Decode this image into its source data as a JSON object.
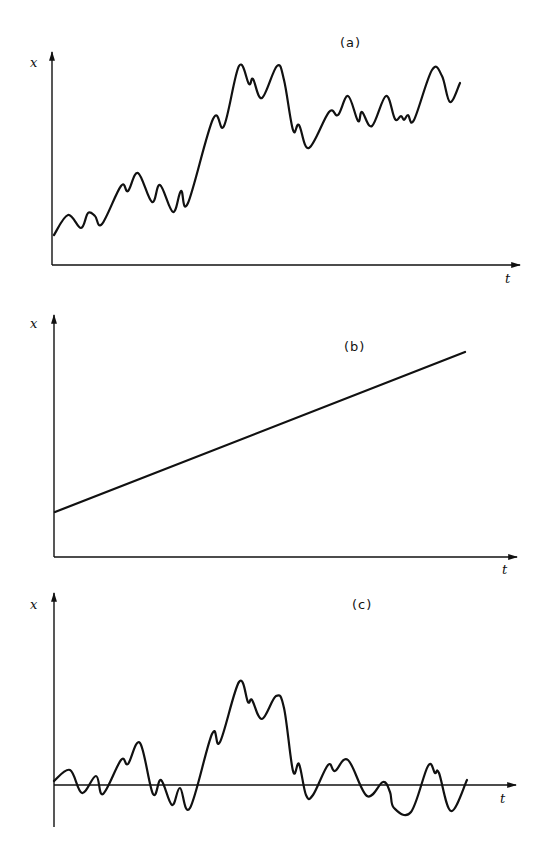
{
  "chart_data": [
    {
      "type": "line",
      "title": "(a)",
      "xlabel": "t",
      "ylabel": "x",
      "grid": false,
      "description": "Random walk with drift (nonstationary, irregular upward trend)",
      "series": [
        {
          "name": "x(t)",
          "points_px": [
            [
              54,
              235
            ],
            [
              68,
              215
            ],
            [
              81,
              228
            ],
            [
              88,
              213
            ],
            [
              95,
              216
            ],
            [
              102,
              224
            ],
            [
              121,
              186
            ],
            [
              128,
              191
            ],
            [
              138,
              173
            ],
            [
              152,
              202
            ],
            [
              160,
              185
            ],
            [
              173,
              212
            ],
            [
              181,
              191
            ],
            [
              188,
              203
            ],
            [
              213,
              119
            ],
            [
              224,
              126
            ],
            [
              239,
              66
            ],
            [
              249,
              84
            ],
            [
              253,
              79
            ],
            [
              262,
              98
            ],
            [
              277,
              66
            ],
            [
              284,
              80
            ],
            [
              293,
              130
            ],
            [
              299,
              125
            ],
            [
              309,
              148
            ],
            [
              329,
              112
            ],
            [
              338,
              115
            ],
            [
              348,
              96
            ],
            [
              358,
              121
            ],
            [
              362,
              112
            ],
            [
              372,
              126
            ],
            [
              386,
              96
            ],
            [
              395,
              119
            ],
            [
              401,
              116
            ],
            [
              404,
              120
            ],
            [
              408,
              115
            ],
            [
              414,
              120
            ],
            [
              432,
              70
            ],
            [
              442,
              76
            ],
            [
              450,
              102
            ],
            [
              460,
              83
            ]
          ]
        }
      ],
      "axes_px": {
        "origin": [
          52,
          265
        ],
        "y_top": 50,
        "x_end": 522
      }
    },
    {
      "type": "line",
      "title": "(b)",
      "xlabel": "t",
      "ylabel": "x",
      "grid": false,
      "description": "Deterministic linear trend",
      "series": [
        {
          "name": "x(t)",
          "points_px": [
            [
              55,
              512
            ],
            [
              465,
              352
            ]
          ]
        }
      ],
      "axes_px": {
        "origin": [
          54,
          557
        ],
        "y_top": 313,
        "x_end": 519
      }
    },
    {
      "type": "line",
      "title": "(c)",
      "xlabel": "t",
      "ylabel": "x",
      "grid": false,
      "description": "Stationary process fluctuating about zero mean",
      "series": [
        {
          "name": "x(t)",
          "points_px": [
            [
              54,
              781
            ],
            [
              70,
              770
            ],
            [
              82,
              793
            ],
            [
              96,
              776
            ],
            [
              103,
              794
            ],
            [
              121,
              760
            ],
            [
              128,
              764
            ],
            [
              140,
              743
            ],
            [
              153,
              794
            ],
            [
              161,
              780
            ],
            [
              172,
              805
            ],
            [
              180,
              788
            ],
            [
              190,
              808
            ],
            [
              212,
              734
            ],
            [
              220,
              742
            ],
            [
              239,
              682
            ],
            [
              248,
              702
            ],
            [
              252,
              700
            ],
            [
              262,
              719
            ],
            [
              276,
              696
            ],
            [
              284,
              708
            ],
            [
              293,
              771
            ],
            [
              299,
              764
            ],
            [
              306,
              795
            ],
            [
              313,
              795
            ],
            [
              328,
              765
            ],
            [
              335,
              771
            ],
            [
              348,
              760
            ],
            [
              367,
              796
            ],
            [
              383,
              782
            ],
            [
              390,
              792
            ],
            [
              394,
              808
            ],
            [
              411,
              812
            ],
            [
              428,
              766
            ],
            [
              435,
              773
            ],
            [
              439,
              773
            ],
            [
              451,
              811
            ],
            [
              467,
              780
            ]
          ]
        }
      ],
      "axes_px": {
        "origin": [
          54,
          785
        ],
        "y_top": 591,
        "y_bottom": 827,
        "x_end": 518
      }
    }
  ],
  "labels": {
    "a": {
      "title": "(a)",
      "x": "x",
      "t": "t"
    },
    "b": {
      "title": "(b)",
      "x": "x",
      "t": "t"
    },
    "c": {
      "title": "(c)",
      "x": "x",
      "t": "t"
    }
  },
  "colors": {
    "ink": "#111111",
    "background": "#ffffff"
  }
}
